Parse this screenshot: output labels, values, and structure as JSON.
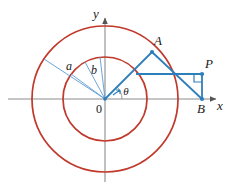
{
  "figure": {
    "background_color": "#ffffff",
    "width": 229,
    "height": 189
  },
  "colors": {
    "circle_stroke": "#c0392b",
    "construction_blue": "#2e7ebb",
    "thin_ray_blue": "#5b9bd5",
    "axis_gray": "#8c8c8c",
    "label_black": "#1a1a1a"
  },
  "axes": {
    "origin_label": "0",
    "x_label": "x",
    "y_label": "y",
    "origin": {
      "x": 105,
      "y": 99
    },
    "x_axis": {
      "x1": 8,
      "y1": 99,
      "x2": 222,
      "y2": 99
    },
    "y_axis": {
      "x1": 105,
      "y1": 182,
      "x2": 105,
      "y2": 14
    },
    "x_arrow": true,
    "y_arrow": true
  },
  "circles": [
    {
      "name": "outer-circle",
      "cx": 105,
      "cy": 99,
      "r": 73,
      "radius_label": "a",
      "stroke": "#c0392b",
      "stroke_width": 1.6
    },
    {
      "name": "inner-circle",
      "cx": 105,
      "cy": 99,
      "r": 42,
      "radius_label": "b",
      "stroke": "#c0392b",
      "stroke_width": 1.6
    }
  ],
  "radius_rays": [
    {
      "name": "radius-a-ray",
      "x1": 105,
      "y1": 99,
      "x2": 44,
      "y2": 59,
      "label": "a",
      "label_x": 69,
      "label_y": 70
    },
    {
      "name": "radius-b-ray-1",
      "x1": 105,
      "y1": 99,
      "x2": 71,
      "y2": 74,
      "label": "",
      "label_x": 0,
      "label_y": 0
    },
    {
      "name": "radius-b-ray-2",
      "x1": 105,
      "y1": 99,
      "x2": 85,
      "y2": 62,
      "label": "",
      "label_x": 0,
      "label_y": 0
    },
    {
      "name": "radius-b-ray-3",
      "x1": 105,
      "y1": 99,
      "x2": 100,
      "y2": 57,
      "label": "b",
      "label_x": 94,
      "label_y": 73
    }
  ],
  "points": [
    {
      "name": "point-a",
      "label": "A",
      "x": 152,
      "y": 52,
      "label_x": 157,
      "label_y": 45
    },
    {
      "name": "point-p",
      "label": "P",
      "x": 202,
      "y": 74,
      "label_x": 206,
      "label_y": 69
    },
    {
      "name": "point-b",
      "label": "B",
      "x": 202,
      "y": 99,
      "label_x": 198,
      "label_y": 112
    }
  ],
  "segments": [
    {
      "name": "segment-oa",
      "x1": 105,
      "y1": 99,
      "x2": 152,
      "y2": 52
    },
    {
      "name": "segment-ab",
      "x1": 152,
      "y1": 52,
      "x2": 202,
      "y2": 99
    },
    {
      "name": "segment-horizontal",
      "x1": 136,
      "y1": 74,
      "x2": 202,
      "y2": 74
    },
    {
      "name": "segment-pb",
      "x1": 202,
      "y1": 74,
      "x2": 202,
      "y2": 99
    }
  ],
  "angle": {
    "name": "theta-angle",
    "label": "θ",
    "label_x": 124,
    "label_y": 93,
    "arc_radius": 17,
    "vertex_x": 105,
    "vertex_y": 99
  },
  "right_angle_marker": {
    "name": "right-angle-at-p",
    "x": 202,
    "y": 74,
    "size": 8
  }
}
